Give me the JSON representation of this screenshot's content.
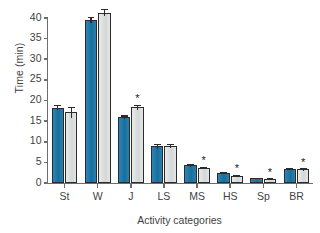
{
  "chart_data": {
    "type": "bar",
    "title": "",
    "xlabel": "Activity categories",
    "ylabel": "Time (min)",
    "ylim": [
      0,
      40
    ],
    "yticks": [
      0,
      5,
      10,
      15,
      20,
      25,
      30,
      35,
      40
    ],
    "ytick_labels": [
      "0",
      "5",
      "10",
      "15",
      "20",
      "25",
      "30",
      "35",
      "40"
    ],
    "grid": false,
    "legend": "none",
    "categories": [
      "St",
      "W",
      "J",
      "LS",
      "MS",
      "HS",
      "Sp",
      "BR"
    ],
    "series": [
      {
        "name": "blue",
        "color": "#1F77A8",
        "values": [
          18.3,
          39.5,
          15.9,
          8.9,
          4.3,
          2.5,
          1.1,
          3.5
        ],
        "errors": [
          0.6,
          0.7,
          0.5,
          0.6,
          0.3,
          0.25,
          0.2,
          0.2
        ]
      },
      {
        "name": "gray",
        "color": "#D8DADA",
        "values": [
          17.1,
          41.3,
          18.4,
          8.9,
          3.6,
          1.8,
          0.9,
          3.3
        ],
        "errors": [
          1.4,
          0.9,
          0.6,
          0.5,
          0.3,
          0.25,
          0.25,
          0.3
        ],
        "annotations": [
          "",
          "",
          "*",
          "",
          "*",
          "*",
          "*",
          "*"
        ]
      }
    ],
    "annotation_symbol": "*",
    "colors": {
      "blue_bar": "#1F77A8",
      "gray_bar": "#D8DADA",
      "bar_outline": "#2B2B2B",
      "axis": "#6D6D6D",
      "text": "#3F3F3F"
    }
  }
}
